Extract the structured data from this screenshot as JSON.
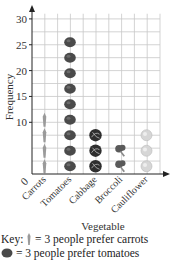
{
  "chart_data": {
    "type": "pictograph",
    "title": "",
    "xlabel": "Vegetable",
    "ylabel": "Frequency",
    "categories": [
      "Carrots",
      "Tomatoes",
      "Cabbage",
      "Broccoli",
      "Cauliflower"
    ],
    "symbol_counts": [
      4,
      9,
      3,
      2,
      3
    ],
    "values": [
      12,
      27,
      9,
      6,
      9
    ],
    "units_per_symbol": 3,
    "yticks": [
      10,
      15,
      20,
      25,
      30
    ],
    "ylim": [
      0,
      30
    ],
    "origin_label": "0",
    "grid": true,
    "legend_position": "bottom"
  },
  "key": {
    "prefix": "Key:",
    "lines": [
      {
        "symbol": "carrot-icon",
        "text": "= 3 people prefer carrots"
      },
      {
        "symbol": "tomato-icon",
        "text": "= 3 people prefer tomatoes"
      }
    ]
  },
  "colors": {
    "grid": "#c8c8c8",
    "axis": "#222222",
    "tomato": "#4a4a4a",
    "cabbage": "#2e2e2e",
    "broccoli": "#5a5a5a",
    "carrot": "#9a9a9a",
    "cauliflower": "#d6d6d6"
  }
}
